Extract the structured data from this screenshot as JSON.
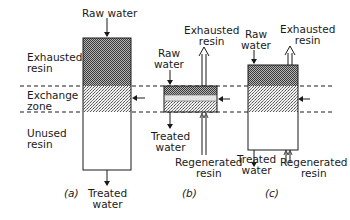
{
  "figure": {
    "panel_a": {
      "caption": "(a)",
      "top_label": "Raw water",
      "bottom_label_1": "Treated",
      "bottom_label_2": "water",
      "zones": {
        "exhausted_1": "Exhausted",
        "exhausted_2": "resin",
        "exchange_1": "Exchange",
        "exchange_2": "zone",
        "unused_1": "Unused",
        "unused_2": "resin"
      }
    },
    "panel_b": {
      "caption": "(b)",
      "raw_1": "Raw",
      "raw_2": "water",
      "exhausted_1": "Exhausted",
      "exhausted_2": "resin",
      "treated_1": "Treated",
      "treated_2": "water",
      "regen_1": "Regenerated",
      "regen_2": "resin"
    },
    "panel_c": {
      "caption": "(c)",
      "raw_1": "Raw",
      "raw_2": "water",
      "exhausted_1": "Exhausted",
      "exhausted_2": "resin",
      "treated_1": "Treated",
      "treated_2": "water",
      "regen_1": "Regenerated",
      "regen_2": "resin"
    }
  },
  "colors": {
    "line": "#1a1a1a",
    "exhausted_fill": "#8a8a8a",
    "exchange_fill": "#cfcfcf",
    "background": "#ffffff"
  }
}
